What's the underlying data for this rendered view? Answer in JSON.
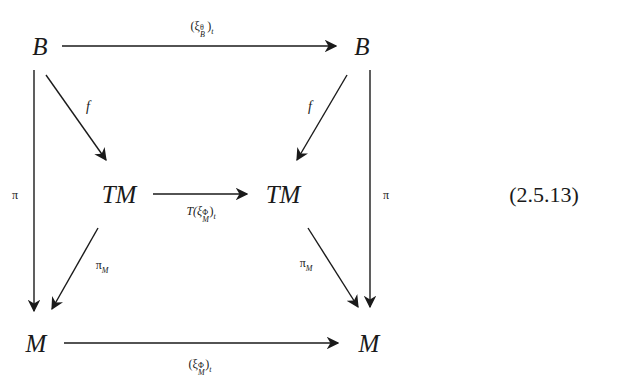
{
  "diagram": {
    "nodes": {
      "b_left": "B",
      "b_right": "B",
      "tm_left": "TM",
      "tm_right": "TM",
      "m_left": "M",
      "m_right": "M"
    },
    "arrows": {
      "top": {
        "from": "B",
        "to": "B",
        "label_base": "(ξ",
        "label_sup": "θ",
        "label_sub": "B",
        "label_tail": ")",
        "label_t": "t"
      },
      "middle": {
        "from": "TM",
        "to": "TM",
        "label_base": "T(ξ",
        "label_sup": "Φ",
        "label_sub": "M",
        "label_tail": ")",
        "label_t": "t"
      },
      "bottom": {
        "from": "M",
        "to": "M",
        "label_base": "(ξ",
        "label_sup": "Φ",
        "label_sub": "M",
        "label_tail": ")",
        "label_t": "t"
      },
      "left_vertical": {
        "from": "B",
        "to": "M",
        "label": "π"
      },
      "right_vertical": {
        "from": "B",
        "to": "M",
        "label": "π"
      },
      "f_left": {
        "from": "B",
        "to": "TM",
        "label": "f"
      },
      "f_right": {
        "from": "B",
        "to": "TM",
        "label": "f"
      },
      "pi_m_left": {
        "from": "TM",
        "to": "M",
        "label_base": "π",
        "label_sub": "M"
      },
      "pi_m_right": {
        "from": "TM",
        "to": "M",
        "label_base": "π",
        "label_sub": "M"
      }
    },
    "equation_number": "(2.5.13)"
  }
}
